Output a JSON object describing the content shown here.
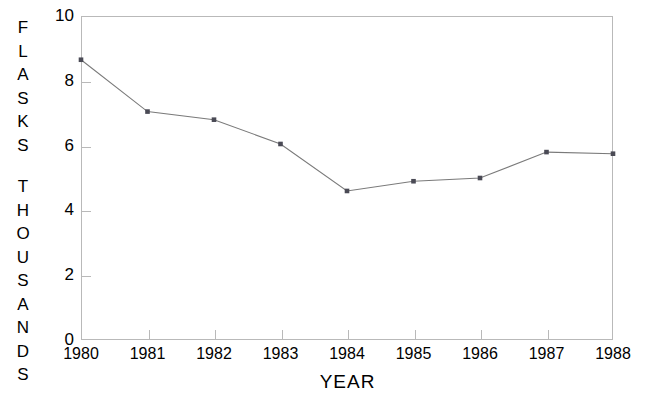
{
  "chart_data": {
    "type": "line",
    "title": "",
    "xlabel": "YEAR",
    "ylabel": "FLASKS THOUSANDS",
    "ylabel_lines": [
      "FLASKS",
      "THOUSANDS"
    ],
    "categories": [
      "1980",
      "1981",
      "1982",
      "1983",
      "1984",
      "1985",
      "1986",
      "1987",
      "1988"
    ],
    "x": [
      1980,
      1981,
      1982,
      1983,
      1984,
      1985,
      1986,
      1987,
      1988
    ],
    "values": [
      8.65,
      7.05,
      6.8,
      6.05,
      4.6,
      4.9,
      5.0,
      5.8,
      5.75
    ],
    "series": [
      {
        "name": "Flasks (thousands)",
        "values": [
          8.65,
          7.05,
          6.8,
          6.05,
          4.6,
          4.9,
          5.0,
          5.8,
          5.75
        ]
      }
    ],
    "ylim": [
      0,
      10
    ],
    "xlim": [
      1980,
      1988
    ],
    "ytick_labels": [
      "0",
      "2",
      "4",
      "6",
      "8",
      "10"
    ],
    "ytick_values": [
      0,
      2,
      4,
      6,
      8,
      10
    ],
    "xtick_labels": [
      "1980",
      "1981",
      "1982",
      "1983",
      "1984",
      "1985",
      "1986",
      "1987",
      "1988"
    ],
    "grid": false,
    "legend": "none",
    "marker": "square",
    "line_color": "#7a7a7a",
    "marker_color": "#4a4a55",
    "axis_color": "#b9b9b9",
    "background_color": "#ffffff"
  }
}
